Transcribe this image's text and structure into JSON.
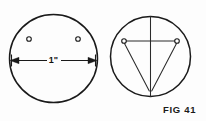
{
  "figure": {
    "caption": "FIG 41",
    "dimension_label": "1\"",
    "background_color": "#fdfdfd",
    "line_color": "#1a1a1a",
    "views": [
      {
        "name": "left-view",
        "description": "front view of disc with two holes and diameter dimension",
        "circle": {
          "cx": 53.5,
          "cy": 58.5,
          "r": 44.0
        },
        "holes": [
          {
            "label": "hole-left",
            "cx": 29,
            "cy": 39,
            "r": 2.3
          },
          {
            "label": "hole-right",
            "cx": 78,
            "cy": 39,
            "r": 2.3
          }
        ],
        "dimension": {
          "label": "1\"",
          "x1": 10.5,
          "x2": 96.5,
          "y": 60.5,
          "arrows": "both"
        }
      },
      {
        "name": "right-view",
        "description": "layout view of disc with centerlines and converging construction lines",
        "circle": {
          "cx": 150.5,
          "cy": 56.5,
          "r": 40.0
        },
        "holes": [
          {
            "label": "hole-left",
            "cx": 124,
            "cy": 41,
            "r": 2.3
          },
          {
            "label": "hole-right",
            "cx": 177,
            "cy": 41,
            "r": 2.3
          }
        ],
        "lines": [
          {
            "label": "vertical-centerline",
            "x1": 150.5,
            "y1": 16.5,
            "x2": 150.5,
            "y2": 96.5
          },
          {
            "label": "horizontal-hole-line",
            "x1": 124,
            "y1": 41,
            "x2": 177,
            "y2": 41
          },
          {
            "label": "diagonal-left",
            "x1": 124,
            "y1": 43,
            "x2": 149,
            "y2": 90
          },
          {
            "label": "diagonal-right",
            "x1": 177,
            "y1": 43,
            "x2": 152,
            "y2": 90
          }
        ]
      }
    ]
  }
}
